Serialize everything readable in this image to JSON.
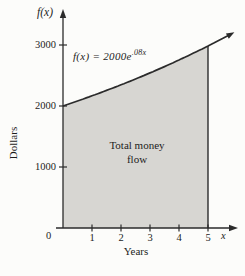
{
  "figure": {
    "y_axis_title": "f(x)",
    "x_axis_letter": "x",
    "origin_label": "0",
    "x_unit_label": "Years",
    "y_unit_label": "Dollars",
    "formula_base": "f(x) = 2000e",
    "formula_exponent": ".08x",
    "region_label_line1": "Total money",
    "region_label_line2": "flow"
  },
  "chart_data": {
    "type": "area",
    "title": "",
    "function_label": "f(x) = 2000e^(.08x)",
    "coefficient": 2000,
    "rate": 0.08,
    "x": [
      0,
      1,
      2,
      3,
      4,
      5
    ],
    "values": [
      2000,
      2166.6,
      2347.0,
      2542.5,
      2754.3,
      2983.6
    ],
    "shaded_domain": [
      0,
      5
    ],
    "curve_extends_to_x": 5.85,
    "xticks": [
      1,
      2,
      3,
      4,
      5
    ],
    "yticks": [
      1000,
      2000,
      3000
    ],
    "xlim": [
      0,
      6
    ],
    "ylim": [
      0,
      3500
    ],
    "xlabel": "Years",
    "ylabel": "Dollars",
    "annotation": "Total money flow",
    "grid": false,
    "legend": false,
    "colors": {
      "fill": "#d7d6d2",
      "line": "#2b2b2b",
      "text": "#1c1c1c",
      "background": "#fcfcfa"
    }
  }
}
